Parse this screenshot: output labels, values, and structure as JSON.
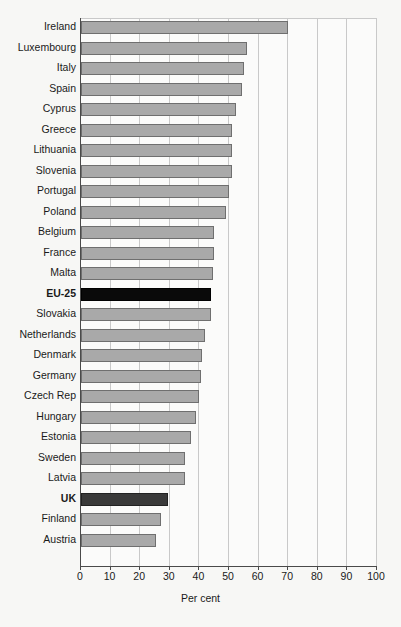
{
  "chart_data": {
    "type": "bar",
    "orientation": "horizontal",
    "title": "",
    "xlabel": "Per cent",
    "ylabel": "",
    "xlim": [
      0,
      100
    ],
    "xticks": [
      0,
      10,
      20,
      30,
      40,
      50,
      60,
      70,
      80,
      90,
      100
    ],
    "xtick_labels": [
      "0",
      "10",
      "20",
      "30",
      "40",
      "50",
      "60",
      "70",
      "80",
      "90",
      "100"
    ],
    "grid": true,
    "grid_axis": "x",
    "legend": false,
    "categories": [
      "Ireland",
      "Luxembourg",
      "Italy",
      "Spain",
      "Cyprus",
      "Greece",
      "Lithuania",
      "Slovenia",
      "Portugal",
      "Poland",
      "Belgium",
      "France",
      "Malta",
      "EU-25",
      "Slovakia",
      "Netherlands",
      "Denmark",
      "Germany",
      "Czech Rep",
      "Hungary",
      "Estonia",
      "Sweden",
      "Latvia",
      "UK",
      "Finland",
      "Austria"
    ],
    "values": [
      70,
      56,
      55,
      54.5,
      52.5,
      51,
      51,
      51,
      50,
      49,
      45,
      45,
      44.5,
      44,
      44,
      42,
      41,
      40.5,
      40,
      39,
      37,
      35,
      35,
      29.5,
      27,
      25.5
    ],
    "highlight_categories": [
      "EU-25",
      "UK"
    ],
    "colors": {
      "bar_fill": "#a9a9a9",
      "bar_border": "#6f6f6f",
      "highlight_fill": "#0a0a0a",
      "uk_fill": "#3a3a3a",
      "background": "#f7f7f5",
      "plot_background": "#fbfbfa",
      "gridline": "#c9c9c9",
      "axis": "#4a4a4a",
      "text": "#1a1a1a"
    }
  }
}
